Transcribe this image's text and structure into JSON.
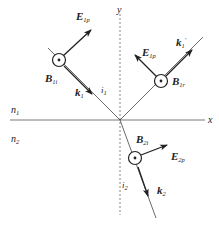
{
  "figure": {
    "type": "physics-diagram"
  },
  "axes": {
    "x_label": "x",
    "y_label": "y"
  },
  "media": {
    "upper": "n",
    "upper_sub": "1",
    "lower": "n",
    "lower_sub": "2"
  },
  "incident": {
    "E_main": "E",
    "E_sub": "1p",
    "B_main": "B",
    "B_sub": "1i",
    "k_main": "k",
    "k_sub": "1",
    "angle_main": "i",
    "angle_sub": "1"
  },
  "reflected": {
    "E_main": "E",
    "E_sub": "1p",
    "E_prime": "′",
    "B_main": "B",
    "B_sub": "1r",
    "k_main": "k",
    "k_sub": "1",
    "k_prime": "′"
  },
  "transmitted": {
    "E_main": "E",
    "E_sub": "2p",
    "B_main": "B",
    "B_sub": "2i",
    "k_main": "k",
    "k_sub": "2",
    "angle_main": "i",
    "angle_sub": "2"
  },
  "colors": {
    "line": "#333333",
    "axis": "#555555",
    "background": "#ffffff"
  }
}
